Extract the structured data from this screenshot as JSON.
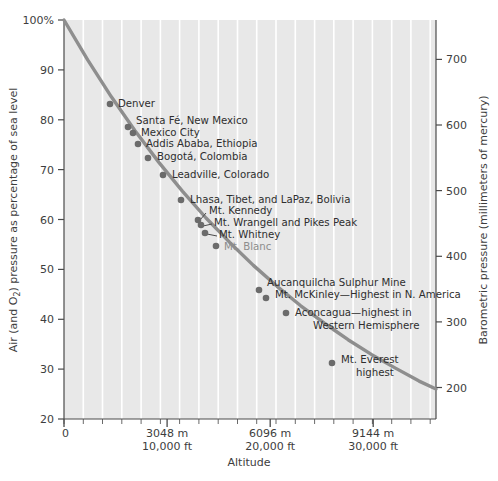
{
  "chart_data": {
    "type": "line",
    "title": "",
    "xlabel": "Altitude",
    "ylabel_left": "Air (and O₂) pressure as percentage of sea level",
    "ylabel_right": "Barometric pressure (millimeters of mercury)",
    "grid": true,
    "legend": "none",
    "xlim": [
      0,
      11000
    ],
    "ylim": [
      20,
      100
    ],
    "y_right_lim": [
      152,
      760
    ],
    "x_ticks_major": [
      {
        "value": 0,
        "label_m": "0",
        "label_ft": ""
      },
      {
        "value": 3048,
        "label_m": "3048 m",
        "label_ft": "10,000 ft"
      },
      {
        "value": 6096,
        "label_m": "6096 m",
        "label_ft": "20,000 ft"
      },
      {
        "value": 9144,
        "label_m": "9144 m",
        "label_ft": "30,000 ft"
      }
    ],
    "y_ticks_left": [
      "100%",
      "90",
      "80",
      "70",
      "60",
      "50",
      "40",
      "30",
      "20"
    ],
    "y_ticks_left_values": [
      100,
      90,
      80,
      70,
      60,
      50,
      40,
      30,
      20
    ],
    "y_ticks_right": [
      "700",
      "600",
      "500",
      "400",
      "300",
      "200"
    ],
    "y_ticks_right_values": [
      700,
      600,
      500,
      400,
      300,
      200
    ],
    "series": [
      {
        "name": "Air pressure vs altitude",
        "x": [
          0,
          700,
          1400,
          2100,
          2800,
          3500,
          4200,
          4900,
          5600,
          6300,
          7000,
          7700,
          8400,
          9100,
          9800,
          10500,
          11000
        ],
        "y": [
          100,
          92.0,
          84.6,
          77.8,
          71.5,
          65.7,
          60.3,
          55.4,
          50.8,
          46.6,
          42.7,
          39.2,
          35.9,
          32.9,
          30.2,
          27.6,
          26.0
        ]
      }
    ],
    "points": [
      {
        "label": "Denver",
        "altitude_m": 1609,
        "pressure_pct": 82.0,
        "px": 110,
        "py": 104,
        "lx": 118,
        "ly": 107,
        "anchor": "start",
        "faded": false,
        "leader": false
      },
      {
        "label": "Santa Fé, New Mexico",
        "altitude_m": 2134,
        "pressure_pct": 77.5,
        "px": 128,
        "py": 127,
        "lx": 136,
        "ly": 124,
        "anchor": "start",
        "faded": false,
        "leader": false
      },
      {
        "label": "Mexico City",
        "altitude_m": 2240,
        "pressure_pct": 76.3,
        "px": 133,
        "py": 133,
        "lx": 141,
        "ly": 136,
        "anchor": "start",
        "faded": false,
        "leader": false
      },
      {
        "label": "Addis Ababa, Ethiopia",
        "altitude_m": 2355,
        "pressure_pct": 74.6,
        "px": 138,
        "py": 144,
        "lx": 146,
        "ly": 147,
        "anchor": "start",
        "faded": false,
        "leader": false
      },
      {
        "label": "Bogotá, Colombia",
        "altitude_m": 2640,
        "pressure_pct": 72.0,
        "px": 148,
        "py": 158,
        "lx": 157,
        "ly": 160,
        "anchor": "start",
        "faded": false,
        "leader": false
      },
      {
        "label": "Leadville, Colorado",
        "altitude_m": 3094,
        "pressure_pct": 68.5,
        "px": 163,
        "py": 175,
        "lx": 172,
        "ly": 178,
        "anchor": "start",
        "faded": false,
        "leader": false
      },
      {
        "label": "Lhasa, Tibet, and LaPaz, Bolivia",
        "altitude_m": 3658,
        "pressure_pct": 63.6,
        "px": 181,
        "py": 200,
        "lx": 190,
        "ly": 203,
        "anchor": "start",
        "faded": false,
        "leader": false
      },
      {
        "label": "Mt. Kennedy",
        "altitude_m": 4237,
        "pressure_pct": 59.2,
        "px": 198,
        "py": 220,
        "lx": 209,
        "ly": 214,
        "anchor": "start",
        "faded": false,
        "leader": true,
        "l1x": 200,
        "l1y": 220,
        "l2x": 206,
        "l2y": 213
      },
      {
        "label": "Mt. Wrangell and Pikes Peak",
        "altitude_m": 4317,
        "pressure_pct": 58.2,
        "px": 201,
        "py": 225,
        "lx": 214,
        "ly": 226,
        "anchor": "start",
        "faded": false,
        "leader": true,
        "l1x": 203,
        "l1y": 226,
        "l2x": 212,
        "l2y": 224
      },
      {
        "label": "Mt. Whitney",
        "altitude_m": 4418,
        "pressure_pct": 56.8,
        "px": 205,
        "py": 233,
        "lx": 219,
        "ly": 238,
        "anchor": "start",
        "faded": false,
        "leader": true,
        "l1x": 207,
        "l1y": 234,
        "l2x": 217,
        "l2y": 236
      },
      {
        "label": "Mt. Blanc",
        "altitude_m": 4810,
        "pressure_pct": 54.3,
        "px": 216,
        "py": 246,
        "lx": 224,
        "ly": 250,
        "anchor": "start",
        "faded": true,
        "leader": false
      },
      {
        "label": "Aucanquilcha Sulphur Mine",
        "altitude_m": 5639,
        "pressure_pct": 46.5,
        "px": 259,
        "py": 290,
        "lx": 267,
        "ly": 286,
        "anchor": "start",
        "faded": false,
        "leader": false
      },
      {
        "label": "Mt. McKinley—Highest in N. America",
        "altitude_m": 6194,
        "pressure_pct": 45.0,
        "px": 266,
        "py": 298,
        "lx": 275,
        "ly": 298,
        "anchor": "start",
        "faded": false,
        "leader": false
      },
      {
        "label": "Aconcagua—highest in",
        "altitude_m": 6961,
        "pressure_pct": 41.5,
        "px": 286,
        "py": 313,
        "lx": 295,
        "ly": 316,
        "anchor": "start",
        "faded": false,
        "leader": false
      },
      {
        "label": "Western Hemisphere",
        "altitude_m": null,
        "pressure_pct": null,
        "px": null,
        "py": null,
        "lx": 313,
        "ly": 329,
        "anchor": "start",
        "faded": false,
        "leader": false
      },
      {
        "label": "Mt. Everest",
        "altitude_m": 8848,
        "pressure_pct": 31.5,
        "px": 332,
        "py": 363,
        "lx": 341,
        "ly": 363,
        "anchor": "start",
        "faded": false,
        "leader": false
      },
      {
        "label": "highest",
        "altitude_m": null,
        "pressure_pct": null,
        "px": null,
        "py": null,
        "lx": 356,
        "ly": 376,
        "anchor": "start",
        "faded": false,
        "leader": false
      }
    ],
    "colors": {
      "curve": "#8e8e8e",
      "marker": "#6b6b6b",
      "plot_background": "#e8e8e8",
      "gridline": "#ffffff",
      "axis": "#4a4a4a",
      "text": "#3a3a3a",
      "page_background": "#ffffff"
    }
  }
}
